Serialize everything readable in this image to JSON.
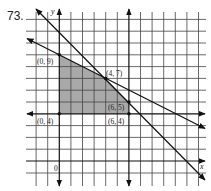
{
  "problem_number": "73.",
  "axes": {
    "x_label": "x",
    "y_label": "y",
    "origin_label": "0"
  },
  "vertices": [
    {
      "label": "(0, 9)",
      "x": 0,
      "y": 9
    },
    {
      "label": "(4, 7)",
      "x": 4,
      "y": 7
    },
    {
      "label": "(6, 5)",
      "x": 6,
      "y": 5
    },
    {
      "label": "(6, 4)",
      "x": 6,
      "y": 4
    },
    {
      "label": "(0, 4)",
      "x": 0,
      "y": 4
    }
  ],
  "boundary_lines": [
    {
      "name": "line-x-plus-2y-equals-18",
      "equation": "y = 9 - x/2"
    },
    {
      "name": "line-x-plus-y-equals-11",
      "equation": "y = 11 - x"
    },
    {
      "name": "line-y-equals-4",
      "equation": "y = 4"
    },
    {
      "name": "line-x-equals-6",
      "equation": "x = 6"
    }
  ],
  "feasible_region": {
    "fill": "#a9a9a9",
    "polygon": "(0,9),(4,7),(6,5),(6,4),(0,4)"
  },
  "colors": {
    "grid": "#333333",
    "line": "#111111",
    "shade": "#a9a9a9"
  }
}
